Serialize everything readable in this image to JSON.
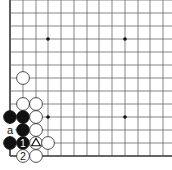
{
  "diagram": {
    "type": "go-board-corner",
    "grid": {
      "x_lines": [
        10,
        23,
        36,
        48,
        61,
        74,
        87,
        99,
        112,
        125,
        138,
        150,
        163
      ],
      "y_lines": [
        0,
        13,
        26,
        39,
        52,
        65,
        78,
        91,
        104,
        117,
        130,
        143,
        156
      ],
      "left_edge_x": 10,
      "bottom_edge_y": 156,
      "line_color": "#555555",
      "edge_color": "#333333"
    },
    "star_points": [
      {
        "x": 48,
        "y": 39
      },
      {
        "x": 125,
        "y": 39
      },
      {
        "x": 48,
        "y": 117
      },
      {
        "x": 125,
        "y": 117
      }
    ],
    "stones": [
      {
        "color": "white",
        "x": 23,
        "y": 78,
        "label": ""
      },
      {
        "color": "white",
        "x": 23,
        "y": 104,
        "label": ""
      },
      {
        "color": "white",
        "x": 36,
        "y": 104,
        "label": ""
      },
      {
        "color": "black",
        "x": 10,
        "y": 117,
        "label": ""
      },
      {
        "color": "black",
        "x": 23,
        "y": 117,
        "label": ""
      },
      {
        "color": "white",
        "x": 36,
        "y": 117,
        "label": ""
      },
      {
        "color": "black",
        "x": 23,
        "y": 130,
        "label": ""
      },
      {
        "color": "white",
        "x": 36,
        "y": 130,
        "label": ""
      },
      {
        "color": "black",
        "x": 10,
        "y": 143,
        "label": ""
      },
      {
        "color": "black",
        "x": 23,
        "y": 143,
        "label": "1"
      },
      {
        "color": "white",
        "x": 36,
        "y": 143,
        "label": "triangle"
      },
      {
        "color": "white",
        "x": 48,
        "y": 143,
        "label": ""
      },
      {
        "color": "white",
        "x": 23,
        "y": 156,
        "label": "2"
      },
      {
        "color": "white",
        "x": 36,
        "y": 156,
        "label": ""
      }
    ],
    "point_labels": [
      {
        "text": "a",
        "x": 10,
        "y": 130
      }
    ],
    "move_labels": {
      "move1": "1",
      "move2": "2",
      "marker": "triangle",
      "point_a": "a"
    }
  }
}
